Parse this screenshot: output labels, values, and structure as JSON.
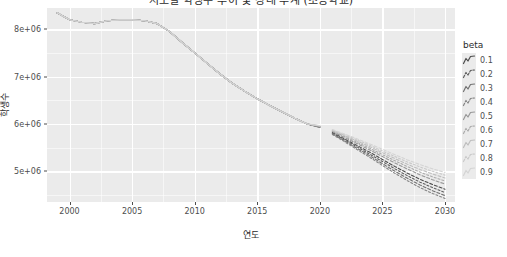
{
  "chart_data": {
    "type": "line",
    "title": "시도별 학생수 추이 및 장래 추계 (초등학교)",
    "xlabel": "연도",
    "ylabel": "학생수",
    "xlim": [
      1998.2,
      2030.8
    ],
    "ylim": [
      4350000,
      8450000
    ],
    "grid": true,
    "legend_position": "right",
    "legend_title": "beta",
    "x_ticks": [
      2000,
      2005,
      2010,
      2015,
      2020,
      2025,
      2030
    ],
    "x_tick_labels": [
      "2000",
      "2005",
      "2010",
      "2015",
      "2020",
      "2025",
      "2030"
    ],
    "y_ticks": [
      5000000,
      6000000,
      7000000,
      8000000
    ],
    "y_tick_labels": [
      "5e+06",
      "6e+06",
      "7e+06",
      "8e+06"
    ],
    "x": [
      1999,
      2000,
      2001,
      2002,
      2003,
      2004,
      2005,
      2006,
      2007,
      2008,
      2009,
      2010,
      2011,
      2012,
      2013,
      2014,
      2015,
      2016,
      2017,
      2018,
      2019,
      2020,
      2021,
      2022,
      2023,
      2024,
      2025,
      2026,
      2027,
      2028,
      2029,
      2030
    ],
    "historical_end_year": 2020,
    "forecast_start_year": 2021,
    "series": [
      {
        "name": "0.1",
        "color": "#4d4d4d",
        "values": [
          8350000,
          8200000,
          8150000,
          8120000,
          8180000,
          8200000,
          8200000,
          8180000,
          8120000,
          7950000,
          7720000,
          7500000,
          7280000,
          7060000,
          6860000,
          6690000,
          6530000,
          6390000,
          6250000,
          6120000,
          6000000,
          5940000,
          5820000,
          5680000,
          5540000,
          5400000,
          5250000,
          5100000,
          4960000,
          4830000,
          4720000,
          4620000
        ]
      },
      {
        "name": "0.2",
        "color": "#5f5f5f",
        "values": [
          8350000,
          8200000,
          8150000,
          8120000,
          8180000,
          8200000,
          8200000,
          8180000,
          8120000,
          7950000,
          7720000,
          7500000,
          7280000,
          7060000,
          6860000,
          6690000,
          6530000,
          6390000,
          6250000,
          6120000,
          6000000,
          5935000,
          5805000,
          5660000,
          5510000,
          5360000,
          5205000,
          5050000,
          4905000,
          4770000,
          4655000,
          4550000
        ]
      },
      {
        "name": "0.3",
        "color": "#727272",
        "values": [
          8350000,
          8200000,
          8150000,
          8120000,
          8180000,
          8200000,
          8200000,
          8180000,
          8120000,
          7950000,
          7720000,
          7500000,
          7280000,
          7060000,
          6860000,
          6690000,
          6530000,
          6390000,
          6250000,
          6120000,
          6000000,
          5930000,
          5790000,
          5640000,
          5480000,
          5325000,
          5160000,
          5000000,
          4850000,
          4710000,
          4590000,
          4485000
        ]
      },
      {
        "name": "0.4",
        "color": "#858585",
        "values": [
          8350000,
          8200000,
          8150000,
          8120000,
          8180000,
          8200000,
          8200000,
          8180000,
          8120000,
          7950000,
          7720000,
          7500000,
          7280000,
          7060000,
          6860000,
          6690000,
          6530000,
          6390000,
          6250000,
          6120000,
          6000000,
          5925000,
          5778000,
          5620000,
          5455000,
          5292000,
          5122000,
          4955000,
          4800000,
          4655000,
          4530000,
          4425000
        ]
      },
      {
        "name": "0.5",
        "color": "#989898",
        "values": [
          8350000,
          8200000,
          8150000,
          8120000,
          8180000,
          8200000,
          8200000,
          8180000,
          8120000,
          7950000,
          7720000,
          7500000,
          7280000,
          7060000,
          6860000,
          6690000,
          6530000,
          6390000,
          6250000,
          6120000,
          6000000,
          5948000,
          5838000,
          5710000,
          5580000,
          5450000,
          5310000,
          5175000,
          5045000,
          4925000,
          4820000,
          4730000
        ]
      },
      {
        "name": "0.6",
        "color": "#ababab",
        "values": [
          8350000,
          8200000,
          8150000,
          8120000,
          8180000,
          8200000,
          8200000,
          8180000,
          8120000,
          7950000,
          7720000,
          7500000,
          7280000,
          7060000,
          6860000,
          6690000,
          6530000,
          6390000,
          6250000,
          6120000,
          6000000,
          5952000,
          5850000,
          5730000,
          5608000,
          5485000,
          5352000,
          5222000,
          5098000,
          4982000,
          4882000,
          4795000
        ]
      },
      {
        "name": "0.7",
        "color": "#bebebe",
        "values": [
          8350000,
          8200000,
          8150000,
          8120000,
          8180000,
          8200000,
          8200000,
          8180000,
          8120000,
          7950000,
          7720000,
          7500000,
          7280000,
          7060000,
          6860000,
          6690000,
          6530000,
          6390000,
          6250000,
          6120000,
          6000000,
          5956000,
          5862000,
          5750000,
          5635000,
          5518000,
          5392000,
          5268000,
          5148000,
          5038000,
          4942000,
          4858000
        ]
      },
      {
        "name": "0.8",
        "color": "#c9c9c9",
        "values": [
          8350000,
          8200000,
          8150000,
          8120000,
          8180000,
          8200000,
          8200000,
          8180000,
          8120000,
          7950000,
          7720000,
          7500000,
          7280000,
          7060000,
          6860000,
          6690000,
          6530000,
          6390000,
          6250000,
          6120000,
          6000000,
          5960000,
          5872000,
          5768000,
          5660000,
          5548000,
          5428000,
          5310000,
          5195000,
          5090000,
          4998000,
          4918000
        ]
      },
      {
        "name": "0.9",
        "color": "#d4d4d4",
        "values": [
          8350000,
          8200000,
          8150000,
          8120000,
          8180000,
          8200000,
          8200000,
          8180000,
          8120000,
          7950000,
          7720000,
          7500000,
          7280000,
          7060000,
          6860000,
          6690000,
          6530000,
          6390000,
          6250000,
          6120000,
          6000000,
          5964000,
          5882000,
          5785000,
          5682000,
          5576000,
          5462000,
          5350000,
          5240000,
          5140000,
          5052000,
          4975000
        ]
      }
    ]
  },
  "legend": {
    "title": "beta",
    "items": [
      {
        "label": "0.1"
      },
      {
        "label": "0.2"
      },
      {
        "label": "0.3"
      },
      {
        "label": "0.4"
      },
      {
        "label": "0.5"
      },
      {
        "label": "0.6"
      },
      {
        "label": "0.7"
      },
      {
        "label": "0.8"
      },
      {
        "label": "0.9"
      }
    ]
  }
}
